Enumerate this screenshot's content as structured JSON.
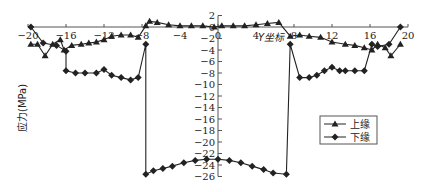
{
  "chart_data": {
    "type": "line",
    "title": "",
    "xlabel": "Y坐标",
    "ylabel": "应力(MPa)",
    "xlim": [
      -20,
      20
    ],
    "ylim": [
      -26,
      2
    ],
    "grid": false,
    "legend_position": "right-middle",
    "x_ticks": [
      -20,
      -16,
      -12,
      -8,
      -4,
      0,
      4,
      8,
      12,
      16,
      20
    ],
    "y_ticks": [
      2,
      0,
      -2,
      -4,
      -6,
      -8,
      -10,
      -12,
      -14,
      -16,
      -18,
      -20,
      -22,
      -24,
      -26
    ],
    "series": [
      {
        "name": "上缘",
        "marker": "triangle",
        "x": [
          -19.7,
          -19.0,
          -18.2,
          -17.4,
          -16.6,
          -16.2,
          -15.4,
          -14.4,
          -13.6,
          -12.8,
          -12.0,
          -11.2,
          -10.2,
          -9.2,
          -8.4,
          -7.6,
          -7.2,
          -6.4,
          -5.2,
          -4.0,
          -2.8,
          -1.6,
          -0.4,
          0.4,
          1.6,
          2.8,
          4.0,
          5.2,
          6.4,
          7.6,
          8.6,
          9.6,
          10.8,
          12.0,
          13.4,
          14.4,
          15.4,
          16.2,
          16.8,
          17.6,
          18.2,
          19.2
        ],
        "values": [
          -3.0,
          -3.0,
          -5.0,
          -3.0,
          -2.2,
          -4.0,
          -3.2,
          -3.0,
          -2.8,
          -2.6,
          -2.2,
          -1.6,
          -1.4,
          -1.4,
          -1.8,
          0.2,
          1.0,
          0.8,
          0.4,
          0.2,
          0.2,
          0.2,
          0.0,
          0.2,
          0.2,
          0.2,
          0.4,
          0.6,
          0.8,
          -1.6,
          -1.4,
          -1.6,
          -1.8,
          -2.6,
          -3.0,
          -3.2,
          -3.6,
          -4.0,
          -3.0,
          -3.6,
          -5.0,
          -3.0
        ]
      },
      {
        "name": "下缘",
        "marker": "diamond",
        "x": [
          -19.7,
          -18.4,
          -17.0,
          -16.0,
          -16.0,
          -15.0,
          -14.0,
          -12.8,
          -12.0,
          -11.2,
          -10.2,
          -9.2,
          -8.4,
          -7.6,
          -7.6,
          -6.8,
          -5.8,
          -4.8,
          -3.6,
          -2.4,
          -1.2,
          0.0,
          1.2,
          2.4,
          3.6,
          4.8,
          5.8,
          7.2,
          7.6,
          8.6,
          9.6,
          10.4,
          11.2,
          12.0,
          12.8,
          13.4,
          14.4,
          15.4,
          16.2,
          16.8,
          18.0,
          19.2
        ],
        "values": [
          0.0,
          -2.8,
          -3.2,
          -4.2,
          -7.6,
          -8.0,
          -8.0,
          -8.0,
          -7.4,
          -8.4,
          -8.8,
          -9.2,
          -8.8,
          -3.0,
          -25.6,
          -25.0,
          -24.6,
          -24.2,
          -23.6,
          -23.2,
          -23.0,
          -23.0,
          -23.2,
          -23.6,
          -24.2,
          -24.8,
          -25.4,
          -25.6,
          -3.0,
          -8.8,
          -8.8,
          -8.4,
          -7.6,
          -7.0,
          -7.6,
          -7.6,
          -7.6,
          -7.6,
          -3.0,
          -3.4,
          -3.0,
          0.0
        ]
      }
    ],
    "legend": [
      "上缘",
      "下缘"
    ],
    "colors": {
      "line": "#222222",
      "axis": "#444444",
      "frame": "#555555"
    }
  }
}
